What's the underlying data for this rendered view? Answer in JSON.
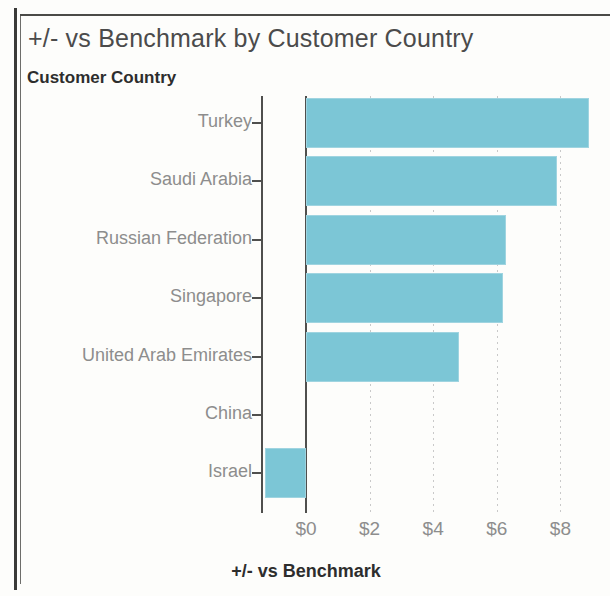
{
  "figure": {
    "title": "+/- vs Benchmark by Customer Country",
    "y_axis_title": "Customer Country",
    "x_axis_title": "+/- vs Benchmark",
    "bar_color": "#7cc6d6",
    "text_color": "#8d8d8d"
  },
  "chart_data": {
    "type": "bar",
    "orientation": "horizontal",
    "title": "+/- vs Benchmark by Customer Country",
    "xlabel": "+/- vs Benchmark",
    "ylabel": "Customer Country",
    "categories": [
      "Turkey",
      "Saudi Arabia",
      "Russian Federation",
      "Singapore",
      "United Arab Emirates",
      "China",
      "Israel"
    ],
    "values": [
      8.9,
      7.9,
      6.3,
      6.2,
      4.8,
      0.0,
      -1.3
    ],
    "xticks": [
      0,
      2,
      4,
      6,
      8
    ],
    "xticklabels": [
      "$0",
      "$2",
      "$4",
      "$6",
      "$8"
    ],
    "xlim": [
      -1.4,
      9.5
    ],
    "grid": "vertical-dotted",
    "legend": "none",
    "series": [
      {
        "name": "+/- vs Benchmark",
        "color": "#7cc6d6",
        "values": [
          8.9,
          7.9,
          6.3,
          6.2,
          4.8,
          0.0,
          -1.3
        ]
      }
    ]
  }
}
